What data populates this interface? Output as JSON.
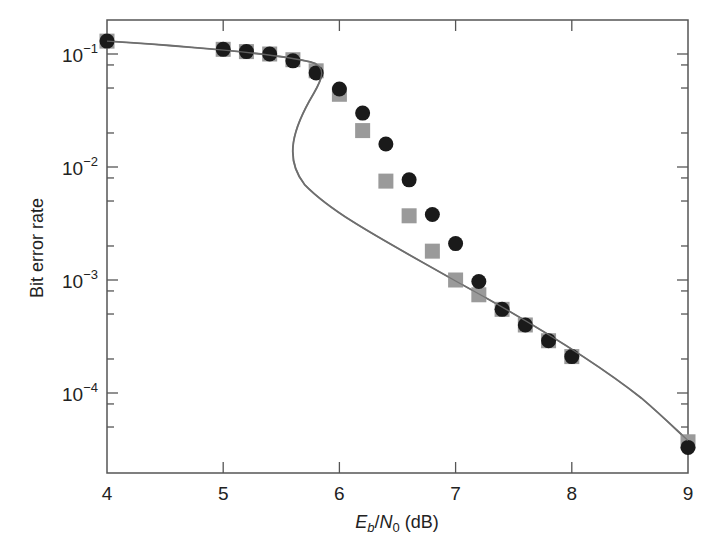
{
  "chart_data": {
    "type": "scatter",
    "title": "",
    "xlabel": "E_b/N_0 (dB)",
    "xlabel_parts": {
      "E": "E",
      "b": "b",
      "slash": "/",
      "N": "N",
      "zero": "0",
      "unit": " (dB)"
    },
    "ylabel": "Bit error rate",
    "xscale": "linear",
    "yscale": "log",
    "xlim": [
      4,
      9
    ],
    "ylim": [
      2e-05,
      0.2
    ],
    "grid": false,
    "legend": null,
    "x_ticks": [
      4,
      5,
      6,
      7,
      8,
      9
    ],
    "x_tick_labels": [
      "4",
      "5",
      "6",
      "7",
      "8",
      "9"
    ],
    "y_ticks": [
      0.1,
      0.01,
      0.001,
      0.0001
    ],
    "y_tick_labels": [
      {
        "base": "10",
        "exp": "−1"
      },
      {
        "base": "10",
        "exp": "−2"
      },
      {
        "base": "10",
        "exp": "−3"
      },
      {
        "base": "10",
        "exp": "−4"
      }
    ],
    "series": [
      {
        "name": "Simulation (circles)",
        "marker": "circle",
        "color": "#1a1a1a",
        "x": [
          4.0,
          5.0,
          5.2,
          5.4,
          5.6,
          5.8,
          6.0,
          6.2,
          6.4,
          6.6,
          6.8,
          7.0,
          7.2,
          7.4,
          7.6,
          7.8,
          8.0,
          9.0
        ],
        "y": [
          0.13,
          0.11,
          0.105,
          0.1,
          0.087,
          0.068,
          0.049,
          0.03,
          0.016,
          0.0077,
          0.0038,
          0.0021,
          0.00097,
          0.00055,
          0.0004,
          0.00029,
          0.00021,
          3.3e-05
        ]
      },
      {
        "name": "Simulation (squares)",
        "marker": "square",
        "color": "#9a9a9a",
        "x": [
          4.0,
          5.0,
          5.2,
          5.4,
          5.6,
          5.8,
          6.0,
          6.2,
          6.4,
          6.6,
          6.8,
          7.0,
          7.2,
          7.4,
          7.6,
          7.8,
          8.0,
          9.0
        ],
        "y": [
          0.13,
          0.11,
          0.105,
          0.1,
          0.089,
          0.071,
          0.044,
          0.021,
          0.0075,
          0.0037,
          0.0018,
          0.001,
          0.00074,
          0.00055,
          0.0004,
          0.00029,
          0.00021,
          3.7e-05
        ]
      },
      {
        "name": "Analytical curve",
        "marker": "none",
        "line": "solid",
        "color": "#6e6e6e",
        "note": "S-shaped curve folding back between ~5.6 and ~5.85 dB",
        "x": [
          4.0,
          4.5,
          5.0,
          5.4,
          5.7,
          5.85,
          5.8,
          5.65,
          5.6,
          5.65,
          5.9,
          6.2,
          6.5,
          7.0,
          7.5,
          8.0,
          8.5,
          9.0
        ],
        "y": [
          0.13,
          0.12,
          0.11,
          0.098,
          0.085,
          0.07,
          0.05,
          0.03,
          0.018,
          0.012,
          0.0045,
          0.0027,
          0.0017,
          0.00098,
          0.0005,
          0.00022,
          0.0001,
          3.8e-05
        ]
      }
    ]
  }
}
